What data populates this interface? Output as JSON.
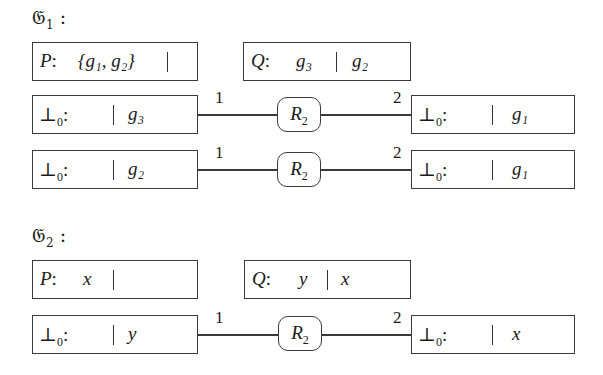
{
  "graphs": [
    {
      "title": {
        "symbol": "𝔊",
        "index": "1",
        "colon": ":"
      },
      "P": {
        "label": "P",
        "colon": ":",
        "left": "{g₁, g₂}",
        "right": ""
      },
      "Q": {
        "label": "Q",
        "colon": ":",
        "left": "g₃",
        "right": "g₂"
      },
      "rows": [
        {
          "left": {
            "label": "⊥",
            "sub": "0",
            "colon": ":",
            "left": "",
            "right": "g₃"
          },
          "node": {
            "label": "R",
            "sub": "2"
          },
          "port_left": "1",
          "port_right": "2",
          "right": {
            "label": "⊥",
            "sub": "0",
            "colon": ":",
            "left": "",
            "right": "g₁"
          }
        },
        {
          "left": {
            "label": "⊥",
            "sub": "0",
            "colon": ":",
            "left": "",
            "right": "g₂"
          },
          "node": {
            "label": "R",
            "sub": "2"
          },
          "port_left": "1",
          "port_right": "2",
          "right": {
            "label": "⊥",
            "sub": "0",
            "colon": ":",
            "left": "",
            "right": "g₁"
          }
        }
      ]
    },
    {
      "title": {
        "symbol": "𝔊",
        "index": "2",
        "colon": ":"
      },
      "P": {
        "label": "P",
        "colon": ":",
        "left": "x",
        "right": ""
      },
      "Q": {
        "label": "Q",
        "colon": ":",
        "left": "y",
        "right": "x"
      },
      "rows": [
        {
          "left": {
            "label": "⊥",
            "sub": "0",
            "colon": ":",
            "left": "",
            "right": "y"
          },
          "node": {
            "label": "R",
            "sub": "2"
          },
          "port_left": "1",
          "port_right": "2",
          "right": {
            "label": "⊥",
            "sub": "0",
            "colon": ":",
            "left": "",
            "right": "x"
          }
        }
      ]
    }
  ]
}
